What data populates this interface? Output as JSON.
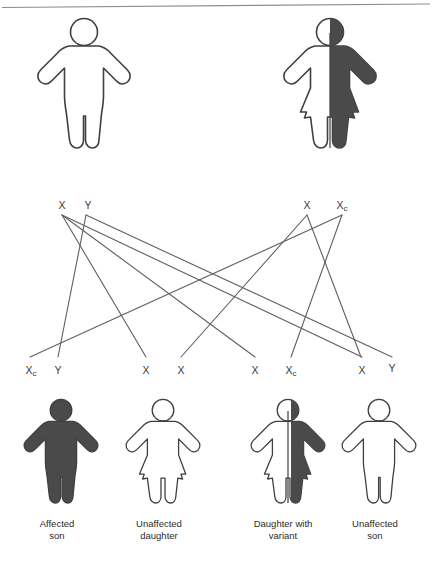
{
  "diagram": {
    "colors": {
      "affected_fill": "#4a4a4a",
      "outline": "#3f3f3f",
      "line": "#5f5f5f",
      "background": "#ffffff",
      "rule": "#8d8d8d"
    },
    "parents": [
      {
        "id": "father",
        "sex": "male",
        "status": "unaffected",
        "fill": "none",
        "alleles": [
          {
            "main": "X",
            "sub": ""
          },
          {
            "main": "Y",
            "sub": ""
          }
        ]
      },
      {
        "id": "mother",
        "sex": "female",
        "status": "carrier",
        "fill": "half",
        "alleles": [
          {
            "main": "X",
            "sub": ""
          },
          {
            "main": "X",
            "sub": "c"
          }
        ]
      }
    ],
    "offspring": [
      {
        "id": "child-1",
        "sex": "male",
        "status": "affected",
        "fill": "full",
        "caption_line1": "Affected",
        "caption_line2": "son",
        "alleles": [
          {
            "main": "X",
            "sub": "c"
          },
          {
            "main": "Y",
            "sub": ""
          }
        ]
      },
      {
        "id": "child-2",
        "sex": "female",
        "status": "unaffected",
        "fill": "none",
        "caption_line1": "Unaffected",
        "caption_line2": "daughter",
        "alleles": [
          {
            "main": "X",
            "sub": ""
          },
          {
            "main": "X",
            "sub": ""
          }
        ]
      },
      {
        "id": "child-3",
        "sex": "female",
        "status": "carrier",
        "fill": "half",
        "caption_line1": "Daughter with",
        "caption_line2": "variant",
        "alleles": [
          {
            "main": "X",
            "sub": ""
          },
          {
            "main": "X",
            "sub": "c"
          }
        ]
      },
      {
        "id": "child-4",
        "sex": "male",
        "status": "unaffected",
        "fill": "none",
        "caption_line1": "Unaffected",
        "caption_line2": "son",
        "alleles": [
          {
            "main": "X",
            "sub": ""
          },
          {
            "main": "Y",
            "sub": ""
          }
        ]
      }
    ]
  }
}
